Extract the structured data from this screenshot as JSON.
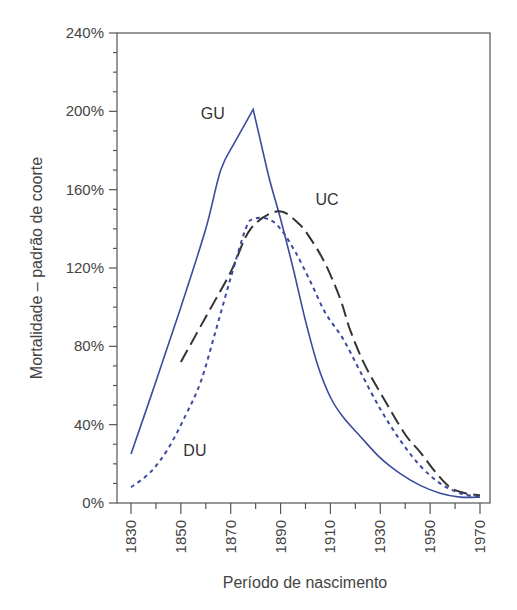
{
  "chart_data": {
    "type": "line",
    "title": "",
    "xlabel": "Período de nascimento",
    "ylabel": "Mortalidade – padrão de coorte",
    "xlim": [
      1830,
      1970
    ],
    "ylim": [
      0,
      240
    ],
    "x_ticks": [
      1830,
      1850,
      1870,
      1890,
      1910,
      1930,
      1950,
      1970
    ],
    "x_minor_step": 10,
    "y_ticks": [
      0,
      40,
      80,
      120,
      160,
      200,
      240
    ],
    "y_tick_labels": [
      "0%",
      "40%",
      "80%",
      "120%",
      "160%",
      "200%",
      "240%"
    ],
    "y_minor_step": 10,
    "grid": false,
    "legend": "inline labels",
    "series": [
      {
        "name": "GU",
        "style": "solid",
        "color": "#3b4a9c",
        "label_pos": [
          1858,
          196
        ],
        "points": [
          [
            1830,
            25
          ],
          [
            1840,
            62
          ],
          [
            1850,
            100
          ],
          [
            1860,
            140
          ],
          [
            1866,
            170
          ],
          [
            1872,
            185
          ],
          [
            1879,
            201
          ],
          [
            1885,
            168
          ],
          [
            1890,
            145
          ],
          [
            1895,
            120
          ],
          [
            1900,
            93
          ],
          [
            1905,
            70
          ],
          [
            1910,
            54
          ],
          [
            1915,
            44
          ],
          [
            1922,
            34
          ],
          [
            1930,
            23
          ],
          [
            1938,
            15
          ],
          [
            1946,
            9
          ],
          [
            1954,
            5
          ],
          [
            1962,
            3
          ],
          [
            1970,
            3
          ]
        ]
      },
      {
        "name": "UC",
        "style": "dashed",
        "color": "#333333",
        "label_pos": [
          1904,
          152
        ],
        "points": [
          [
            1850,
            72
          ],
          [
            1860,
            95
          ],
          [
            1870,
            118
          ],
          [
            1878,
            140
          ],
          [
            1889,
            149
          ],
          [
            1897,
            143
          ],
          [
            1902,
            135
          ],
          [
            1908,
            122
          ],
          [
            1914,
            104
          ],
          [
            1918,
            88
          ],
          [
            1924,
            70
          ],
          [
            1932,
            52
          ],
          [
            1940,
            35
          ],
          [
            1946,
            26
          ],
          [
            1952,
            16
          ],
          [
            1958,
            8
          ],
          [
            1964,
            5
          ],
          [
            1970,
            4
          ]
        ]
      },
      {
        "name": "DU",
        "style": "dotted",
        "color": "#3b4a9c",
        "label_pos": [
          1851,
          24
        ],
        "points": [
          [
            1830,
            8
          ],
          [
            1838,
            16
          ],
          [
            1845,
            28
          ],
          [
            1852,
            45
          ],
          [
            1858,
            62
          ],
          [
            1864,
            88
          ],
          [
            1870,
            115
          ],
          [
            1876,
            140
          ],
          [
            1879,
            145
          ],
          [
            1885,
            145
          ],
          [
            1890,
            140
          ],
          [
            1896,
            128
          ],
          [
            1902,
            113
          ],
          [
            1908,
            97
          ],
          [
            1915,
            84
          ],
          [
            1922,
            67
          ],
          [
            1930,
            48
          ],
          [
            1938,
            32
          ],
          [
            1946,
            19
          ],
          [
            1954,
            10
          ],
          [
            1962,
            5
          ],
          [
            1970,
            3
          ]
        ]
      }
    ]
  }
}
